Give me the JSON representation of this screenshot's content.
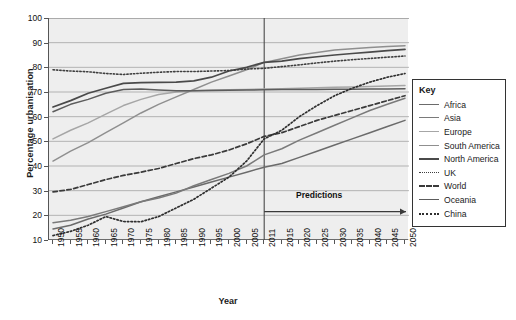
{
  "chart_data": {
    "type": "line",
    "title": "",
    "xlabel": "Year",
    "ylabel": "Percentage urbanisation",
    "ylim": [
      10,
      100
    ],
    "ystep": 10,
    "ytick_labels": [
      "100",
      "90",
      "80",
      "70",
      "60",
      "50",
      "40",
      "30",
      "20",
      "10"
    ],
    "xtick_labels": [
      "1950",
      "1955",
      "1960",
      "1965",
      "1970",
      "1975",
      "1980",
      "1985",
      "1990",
      "1995",
      "2000",
      "2005",
      "2011",
      "2015",
      "2020",
      "2025",
      "2030",
      "2035",
      "2040",
      "2045",
      "2050"
    ],
    "x": [
      1950,
      1955,
      1960,
      1965,
      1970,
      1975,
      1980,
      1985,
      1990,
      1995,
      2000,
      2005,
      2011,
      2015,
      2020,
      2025,
      2030,
      2035,
      2040,
      2045,
      2050
    ],
    "grid": "horizontal",
    "legend_position": "right-outside",
    "divider_year": "2011",
    "annotation": "Predictions",
    "series": [
      {
        "name": "Africa",
        "color": "#6b6b6b",
        "style": "solid",
        "width": 1.5,
        "values": [
          14.5,
          16,
          18.5,
          20.5,
          23,
          25.5,
          27.5,
          29.5,
          31.5,
          33.5,
          35.5,
          37.5,
          39.5,
          41,
          43.5,
          46,
          48.5,
          51,
          53.5,
          56,
          58.5
        ]
      },
      {
        "name": "Asia",
        "color": "#7a7a7a",
        "style": "solid",
        "width": 1.5,
        "values": [
          17,
          18,
          19.5,
          21.5,
          23.5,
          25.5,
          27,
          29,
          32,
          34.5,
          37,
          40,
          44.5,
          47,
          50.5,
          53.5,
          56.5,
          59.5,
          62.5,
          65,
          67.5
        ]
      },
      {
        "name": "Europe",
        "color": "#a6a6a6",
        "style": "solid",
        "width": 1.5,
        "values": [
          51,
          54.5,
          57.5,
          61,
          64.5,
          67,
          69,
          70,
          70.5,
          70.8,
          70.9,
          71,
          71.2,
          71.3,
          71.5,
          71.7,
          71.9,
          72,
          72.2,
          72.4,
          72.6
        ]
      },
      {
        "name": "South America",
        "color": "#8f8f8f",
        "style": "solid",
        "width": 1.5,
        "values": [
          42,
          46,
          49.5,
          53.5,
          57.5,
          61.5,
          65,
          68,
          71,
          74,
          76.5,
          79,
          82,
          83.5,
          85,
          86,
          87,
          87.5,
          88,
          88.4,
          88.8
        ]
      },
      {
        "name": "North America",
        "color": "#4a4a4a",
        "style": "solid",
        "width": 1.7,
        "values": [
          63.9,
          66.5,
          69.5,
          71.5,
          73.5,
          73.8,
          73.9,
          74,
          74.5,
          76,
          78.5,
          80,
          82,
          82.5,
          83.5,
          84.3,
          85,
          85.6,
          86.2,
          86.8,
          87.3
        ]
      },
      {
        "name": "UK",
        "color": "#3f3f3f",
        "style": "dotted",
        "width": 1.6,
        "values": [
          79,
          78.5,
          78.2,
          77.5,
          77.1,
          77.6,
          78,
          78.3,
          78.3,
          78.5,
          78.7,
          79.3,
          79.6,
          80.3,
          81,
          81.8,
          82.5,
          83.1,
          83.6,
          84.1,
          84.6
        ]
      },
      {
        "name": "World",
        "color": "#3a3a3a",
        "style": "dashed",
        "width": 1.7,
        "values": [
          29.5,
          30.5,
          32.5,
          34.5,
          36.2,
          37.5,
          39,
          41,
          43,
          44.5,
          46.5,
          49,
          52,
          53.5,
          56,
          58.5,
          60.5,
          62.5,
          64.5,
          66.5,
          68.5
        ]
      },
      {
        "name": "Oceania",
        "color": "#5c5c5c",
        "style": "solid",
        "width": 1.5,
        "values": [
          62,
          65,
          67,
          69.5,
          71,
          71.2,
          70.8,
          70.5,
          70.5,
          70.6,
          70.7,
          70.8,
          70.9,
          71,
          71,
          71,
          71.1,
          71.1,
          71.2,
          71.2,
          71.3
        ]
      },
      {
        "name": "China",
        "color": "#2f2f2f",
        "style": "dotted",
        "width": 1.7,
        "values": [
          11.8,
          13.5,
          16,
          19.5,
          17.5,
          17.4,
          19.5,
          23,
          26.5,
          31,
          35.5,
          42,
          51,
          54.5,
          60,
          64.5,
          68.5,
          71.5,
          74,
          76,
          77.5
        ]
      }
    ]
  },
  "legend": {
    "title": "Key",
    "items": [
      {
        "label": "Africa"
      },
      {
        "label": "Asia"
      },
      {
        "label": "Europe"
      },
      {
        "label": "South America"
      },
      {
        "label": "North America"
      },
      {
        "label": "UK"
      },
      {
        "label": "World"
      },
      {
        "label": "Oceania"
      },
      {
        "label": "China"
      }
    ]
  }
}
